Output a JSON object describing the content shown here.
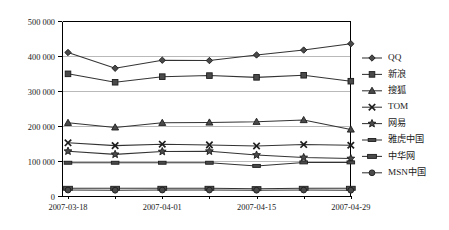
{
  "chart_data": {
    "type": "line",
    "title": "",
    "xlabel": "",
    "ylabel": "",
    "x": [
      "2007-03-18",
      "2007-03-25",
      "2007-04-01",
      "2007-04-08",
      "2007-04-15",
      "2007-04-22",
      "2007-04-29"
    ],
    "x_tick_labels": [
      "2007-03-18",
      "2007-04-01",
      "2007-04-15",
      "2007-04-29"
    ],
    "x_tick_indices": [
      0,
      2,
      4,
      6
    ],
    "y_tick_labels": [
      "0",
      "100 000",
      "200 000",
      "300 000",
      "400 000",
      "500 000"
    ],
    "y_tick_values": [
      0,
      100000,
      200000,
      300000,
      400000,
      500000
    ],
    "ylim": [
      0,
      500000
    ],
    "grid": true,
    "legend_position": "right",
    "series": [
      {
        "name": "QQ",
        "marker": "diamond",
        "values": [
          410000,
          365000,
          388000,
          387000,
          403000,
          417000,
          435000
        ]
      },
      {
        "name": "新浪",
        "marker": "square",
        "values": [
          349000,
          325000,
          341000,
          344000,
          339000,
          345000,
          328000
        ]
      },
      {
        "name": "搜狐",
        "marker": "triangle",
        "values": [
          209000,
          196000,
          209000,
          210000,
          212000,
          217000,
          190000
        ]
      },
      {
        "name": "TOM",
        "marker": "cross",
        "values": [
          152000,
          144000,
          148000,
          146000,
          143000,
          147000,
          145000
        ]
      },
      {
        "name": "网易",
        "marker": "star",
        "values": [
          128000,
          119000,
          127000,
          128000,
          117000,
          110000,
          107000
        ]
      },
      {
        "name": "雅虎中国",
        "marker": "dash",
        "values": [
          95000,
          95000,
          95000,
          95000,
          86000,
          96000,
          96000
        ]
      },
      {
        "name": "中华网",
        "marker": "rect",
        "values": [
          22000,
          22000,
          22000,
          22000,
          21000,
          22000,
          22000
        ]
      },
      {
        "name": "MSN中国",
        "marker": "circle",
        "values": [
          17000,
          16500,
          17000,
          17000,
          16500,
          17000,
          16500
        ]
      }
    ]
  },
  "colors": {
    "line": "#333333",
    "grid": "#b9b9b9",
    "axis": "#000000",
    "text": "#1a1a1a",
    "background": "#ffffff"
  }
}
